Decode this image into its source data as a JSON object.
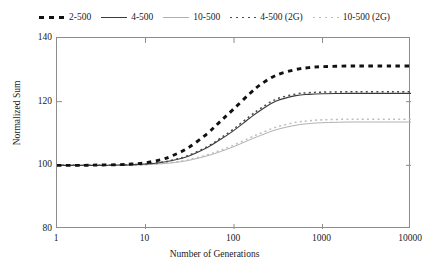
{
  "chart_data": {
    "type": "line",
    "title": "",
    "xlabel": "Number of Generations",
    "ylabel": "Normalized Sum",
    "xscale": "log",
    "xlim": [
      1,
      10000
    ],
    "ylim": [
      80,
      140
    ],
    "xticks": [
      "1",
      "10",
      "100",
      "1000",
      "10000"
    ],
    "xtick_values": [
      1,
      10,
      100,
      1000,
      10000
    ],
    "yticks": [
      "80",
      "100",
      "120",
      "140"
    ],
    "ytick_values": [
      80,
      100,
      120,
      140
    ],
    "grid": false,
    "legend_position": "top",
    "x": [
      1,
      2,
      3,
      5,
      7,
      10,
      15,
      20,
      30,
      50,
      70,
      100,
      150,
      200,
      300,
      500,
      700,
      1000,
      2000,
      3000,
      5000,
      7000,
      10000
    ],
    "series": [
      {
        "name": "2-500",
        "style": "thick-dashed",
        "color": "#111111",
        "values": [
          100.0,
          100.0,
          100.1,
          100.2,
          100.4,
          100.8,
          101.8,
          103.0,
          105.4,
          110.0,
          113.8,
          117.8,
          122.5,
          125.4,
          128.3,
          130.1,
          130.7,
          131.0,
          131.2,
          131.2,
          131.2,
          131.2,
          131.2
        ]
      },
      {
        "name": "4-500",
        "style": "solid-dark",
        "color": "#3a3a3a",
        "values": [
          100.0,
          100.0,
          100.0,
          100.1,
          100.2,
          100.4,
          100.9,
          101.5,
          102.8,
          105.6,
          108.1,
          111.0,
          114.8,
          117.3,
          120.2,
          121.9,
          122.3,
          122.5,
          122.6,
          122.6,
          122.6,
          122.6,
          122.6
        ]
      },
      {
        "name": "10-500",
        "style": "solid-light",
        "color": "#b0b0b0",
        "values": [
          100.0,
          100.0,
          100.0,
          100.0,
          100.1,
          100.2,
          100.5,
          100.8,
          101.5,
          103.0,
          104.3,
          105.9,
          108.0,
          109.4,
          111.2,
          112.6,
          113.1,
          113.4,
          113.6,
          113.6,
          113.6,
          113.6,
          113.6
        ]
      },
      {
        "name": "4-500 (2G)",
        "style": "dotted-dark",
        "color": "#4a4a4a",
        "values": [
          100.0,
          100.0,
          100.0,
          100.1,
          100.2,
          100.4,
          101.0,
          101.6,
          103.0,
          105.9,
          108.5,
          111.5,
          115.4,
          117.9,
          120.8,
          122.4,
          122.8,
          123.0,
          123.1,
          123.1,
          123.1,
          123.1,
          123.1
        ]
      },
      {
        "name": "10-500 (2G)",
        "style": "dotted-light",
        "color": "#bdbdbd",
        "values": [
          100.0,
          100.0,
          100.0,
          100.0,
          100.1,
          100.2,
          100.6,
          100.9,
          101.7,
          103.3,
          104.7,
          106.4,
          108.6,
          110.1,
          112.0,
          113.5,
          114.0,
          114.3,
          114.5,
          114.5,
          114.5,
          114.5,
          114.5
        ]
      }
    ]
  },
  "legend": {
    "items": [
      {
        "label": "2-500",
        "style": "thickdash"
      },
      {
        "label": "4-500",
        "style": "solid-dark"
      },
      {
        "label": "10-500",
        "style": "solid-light"
      },
      {
        "label": "4-500 (2G)",
        "style": "dot-dark"
      },
      {
        "label": "10-500 (2G)",
        "style": "dot-light"
      }
    ]
  }
}
